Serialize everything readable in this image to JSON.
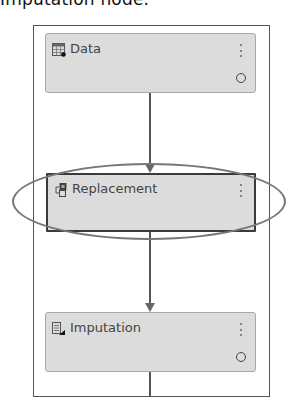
{
  "caption": "Imputation node.",
  "pipeline": {
    "nodes": [
      {
        "id": "data",
        "label": "Data",
        "icon": "data-table-icon",
        "selected": false,
        "has_status": true
      },
      {
        "id": "replacement",
        "label": "Replacement",
        "icon": "replacement-icon",
        "selected": true,
        "has_status": false
      },
      {
        "id": "imputation",
        "label": "Imputation",
        "icon": "imputation-icon",
        "selected": false,
        "has_status": true
      }
    ],
    "edges": [
      {
        "from": "data",
        "to": "replacement"
      },
      {
        "from": "replacement",
        "to": "imputation"
      }
    ]
  },
  "annotation": {
    "type": "ellipse-highlight",
    "target": "replacement",
    "color": "#777777"
  },
  "colors": {
    "node_fill": "#dcdcdc",
    "node_border": "#a8a8a8",
    "selected_border": "#3a3a3a",
    "connector": "#555555"
  }
}
